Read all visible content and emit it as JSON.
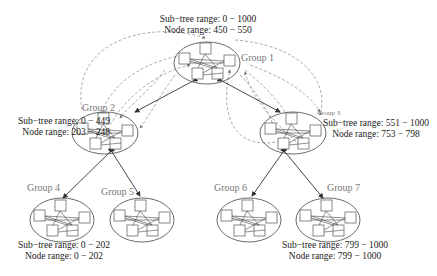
{
  "diagram": {
    "type": "hierarchical-group-tree",
    "groups": [
      {
        "id": 1,
        "label": "Group 1",
        "subtree": "Sub−tree range: 0 − 1000",
        "node": "Node range: 450 − 550"
      },
      {
        "id": 2,
        "label": "Group 2",
        "subtree": "Sub−tree range: 0 − 449",
        "node": "Node range: 203 − 248"
      },
      {
        "id": 3,
        "label": "Group 3",
        "subtree": "Sub−tree range: 551 − 1000",
        "node": "Node range: 753 − 798"
      },
      {
        "id": 4,
        "label": "Group 4",
        "subtree": "Sub−tree range: 0 − 202",
        "node": "Node range: 0 − 202"
      },
      {
        "id": 5,
        "label": "Group 5"
      },
      {
        "id": 6,
        "label": "Group 6"
      },
      {
        "id": 7,
        "label": "Group 7",
        "subtree": "Sub−tree range: 799 − 1000",
        "node": "Node range: 799 − 1000"
      }
    ],
    "edges": [
      {
        "from": 1,
        "to": 2,
        "style": "solid-bidirectional"
      },
      {
        "from": 1,
        "to": 3,
        "style": "solid-bidirectional"
      },
      {
        "from": 2,
        "to": 4,
        "style": "solid-bidirectional"
      },
      {
        "from": 2,
        "to": 5,
        "style": "solid-bidirectional"
      },
      {
        "from": 3,
        "to": 6,
        "style": "solid-bidirectional"
      },
      {
        "from": 3,
        "to": 7,
        "style": "solid-bidirectional"
      },
      {
        "from": 1,
        "to": 2,
        "style": "dashed-member-links"
      },
      {
        "from": 1,
        "to": 3,
        "style": "dashed-member-links"
      }
    ],
    "colors": {
      "solid_edge": "#333333",
      "dashed_edge": "#888888",
      "group_label": "#777777",
      "text": "#1a1a1a"
    }
  }
}
